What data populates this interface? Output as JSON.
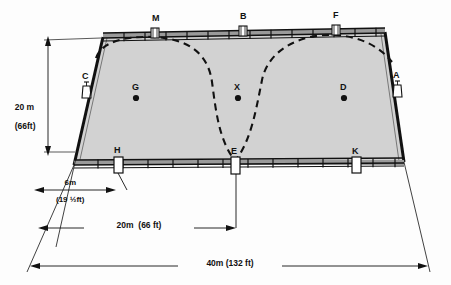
{
  "diagram": {
    "type": "technical-perspective-drawing",
    "field": {
      "shape": "trapezoid-perspective",
      "fill_color": "#d2d2d2",
      "outline_color": "#1a1a1a",
      "width_label": "40m (132 ft)",
      "depth_label": "20 m\n(66ft)"
    },
    "rails": {
      "top_rail_color": "#8a8a8a",
      "bottom_rail_color": "#8a8a8a",
      "tick_color": "#1a1a1a",
      "top_tick_count": 13,
      "bottom_tick_count": 13
    },
    "path": {
      "style": "dashed",
      "color": "#111111",
      "description": "serpentine double-loop route"
    },
    "markers": [
      {
        "id": "M",
        "label": "M",
        "edge": "top",
        "x": 155,
        "y": 36,
        "label_x": 152,
        "label_y": 14
      },
      {
        "id": "B",
        "label": "B",
        "edge": "top",
        "x": 243,
        "y": 34,
        "label_x": 240,
        "label_y": 12
      },
      {
        "id": "F",
        "label": "F",
        "edge": "top",
        "x": 336,
        "y": 33,
        "label_x": 333,
        "label_y": 11
      },
      {
        "id": "C",
        "label": "C",
        "edge": "left",
        "x": 86,
        "y": 93,
        "label_x": 82,
        "label_y": 72
      },
      {
        "id": "A",
        "label": "A",
        "edge": "right",
        "x": 396,
        "y": 92,
        "label_x": 393,
        "label_y": 71
      },
      {
        "id": "H",
        "label": "H",
        "edge": "bottom",
        "x": 118,
        "y": 162,
        "label_x": 114,
        "label_y": 146
      },
      {
        "id": "E",
        "label": "E",
        "edge": "bottom",
        "x": 235,
        "y": 163,
        "label_x": 231,
        "label_y": 147
      },
      {
        "id": "K",
        "label": "K",
        "edge": "bottom",
        "x": 356,
        "y": 162,
        "label_x": 352,
        "label_y": 147
      }
    ],
    "points": [
      {
        "id": "G",
        "label": "G",
        "x": 136,
        "y": 98,
        "label_x": 132,
        "label_y": 83
      },
      {
        "id": "X",
        "label": "X",
        "x": 238,
        "y": 98,
        "label_x": 234,
        "label_y": 83
      },
      {
        "id": "D",
        "label": "D",
        "x": 344,
        "y": 98,
        "label_x": 340,
        "label_y": 83
      }
    ],
    "dimensions": [
      {
        "id": "depth",
        "line1": "20 m",
        "line2": "(66ft)",
        "label_x": 14,
        "label_y": 96
      },
      {
        "id": "offset",
        "line1": "6m",
        "line2": "(19 ½ft)",
        "label_x": 44,
        "label_y": 172
      },
      {
        "id": "half",
        "text": "20m  (66 ft)",
        "label_x": 88,
        "label_y": 213
      },
      {
        "id": "full",
        "text": "40m (132 ft)",
        "label_x": 192,
        "label_y": 252
      }
    ]
  }
}
